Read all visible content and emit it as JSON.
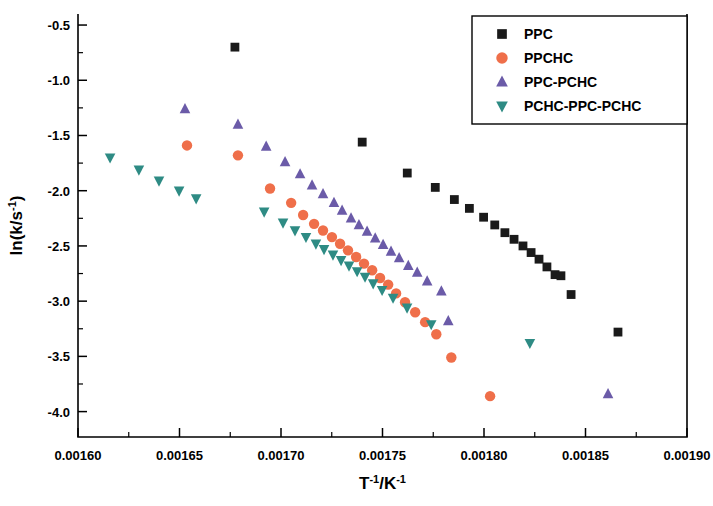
{
  "chart_data": {
    "type": "scatter",
    "title": "",
    "xlabel": "T-1/K-1",
    "xlabel_base": "T",
    "xlabel_exp1": "-1",
    "xlabel_mid": "/K",
    "xlabel_exp2": "-1",
    "ylabel": "ln(k/s-1)",
    "ylabel_base": "ln(k/s",
    "ylabel_exp": "-1",
    "ylabel_close": ")",
    "xlim": [
      0.0016,
      0.0019
    ],
    "ylim": [
      -4.23,
      -0.4
    ],
    "xticks": [
      "0.00160",
      "0.00165",
      "0.00170",
      "0.00175",
      "0.00180",
      "0.00185",
      "0.00190"
    ],
    "xtick_values": [
      0.0016,
      0.00165,
      0.0017,
      0.00175,
      0.0018,
      0.00185,
      0.0019
    ],
    "yticks": [
      "-0.5",
      "-1.0",
      "-1.5",
      "-2.0",
      "-2.5",
      "-3.0",
      "-3.5",
      "-4.0"
    ],
    "ytick_values": [
      -0.5,
      -1.0,
      -1.5,
      -2.0,
      -2.5,
      -3.0,
      -3.5,
      -4.0
    ],
    "grid": false,
    "legend_position": "top-right",
    "series": [
      {
        "name": "PPC",
        "marker": "square",
        "color": "#1a1a1a",
        "points": [
          [
            0.0016773,
            -0.7
          ],
          [
            0.00174,
            -1.56
          ],
          [
            0.0017622,
            -1.84
          ],
          [
            0.001776,
            -1.97
          ],
          [
            0.0017854,
            -2.08
          ],
          [
            0.0017928,
            -2.16
          ],
          [
            0.0017998,
            -2.24
          ],
          [
            0.0018053,
            -2.31
          ],
          [
            0.0018103,
            -2.38
          ],
          [
            0.0018148,
            -2.44
          ],
          [
            0.0018192,
            -2.5
          ],
          [
            0.0018232,
            -2.56
          ],
          [
            0.0018271,
            -2.62
          ],
          [
            0.001831,
            -2.69
          ],
          [
            0.001835,
            -2.76
          ],
          [
            0.0018379,
            -2.77
          ],
          [
            0.0018429,
            -2.94
          ],
          [
            0.001866,
            -3.28
          ]
        ]
      },
      {
        "name": "PPCHC",
        "marker": "circle",
        "color": "#ef6f4a",
        "points": [
          [
            0.0016537,
            -1.59
          ],
          [
            0.0016788,
            -1.68
          ],
          [
            0.0016946,
            -1.98
          ],
          [
            0.001705,
            -2.11
          ],
          [
            0.0017109,
            -2.22
          ],
          [
            0.0017163,
            -2.3
          ],
          [
            0.0017207,
            -2.36
          ],
          [
            0.0017251,
            -2.42
          ],
          [
            0.0017291,
            -2.48
          ],
          [
            0.001733,
            -2.54
          ],
          [
            0.001737,
            -2.6
          ],
          [
            0.0017409,
            -2.66
          ],
          [
            0.0017449,
            -2.72
          ],
          [
            0.0017488,
            -2.79
          ],
          [
            0.0017528,
            -2.85
          ],
          [
            0.0017567,
            -2.93
          ],
          [
            0.0017611,
            -3.01
          ],
          [
            0.0017661,
            -3.1
          ],
          [
            0.001771,
            -3.19
          ],
          [
            0.0017765,
            -3.3
          ],
          [
            0.0017839,
            -3.51
          ],
          [
            0.001803,
            -3.86
          ]
        ]
      },
      {
        "name": "PPC-PCHC",
        "marker": "triangle-up",
        "color": "#6b5ba8",
        "points": [
          [
            0.0016527,
            -1.26
          ],
          [
            0.0016788,
            -1.4
          ],
          [
            0.0016927,
            -1.6
          ],
          [
            0.001702,
            -1.74
          ],
          [
            0.0017094,
            -1.85
          ],
          [
            0.0017153,
            -1.95
          ],
          [
            0.0017207,
            -2.03
          ],
          [
            0.0017261,
            -2.11
          ],
          [
            0.0017301,
            -2.18
          ],
          [
            0.0017345,
            -2.25
          ],
          [
            0.0017384,
            -2.31
          ],
          [
            0.0017424,
            -2.37
          ],
          [
            0.0017464,
            -2.43
          ],
          [
            0.0017503,
            -2.49
          ],
          [
            0.0017542,
            -2.55
          ],
          [
            0.0017582,
            -2.61
          ],
          [
            0.0017627,
            -2.68
          ],
          [
            0.0017671,
            -2.74
          ],
          [
            0.001772,
            -2.82
          ],
          [
            0.001779,
            -2.91
          ],
          [
            0.0017824,
            -3.18
          ],
          [
            0.0018611,
            -3.84
          ]
        ]
      },
      {
        "name": "PCHC-PPC-PCHC",
        "marker": "triangle-down",
        "color": "#2e8b84",
        "points": [
          [
            0.0016158,
            -1.7
          ],
          [
            0.00163,
            -1.81
          ],
          [
            0.0016399,
            -1.91
          ],
          [
            0.0016498,
            -2.0
          ],
          [
            0.0016582,
            -2.07
          ],
          [
            0.0016917,
            -2.19
          ],
          [
            0.001701,
            -2.29
          ],
          [
            0.0017069,
            -2.36
          ],
          [
            0.0017123,
            -2.42
          ],
          [
            0.0017172,
            -2.48
          ],
          [
            0.0017212,
            -2.53
          ],
          [
            0.0017256,
            -2.58
          ],
          [
            0.0017296,
            -2.63
          ],
          [
            0.0017335,
            -2.68
          ],
          [
            0.0017375,
            -2.73
          ],
          [
            0.0017414,
            -2.78
          ],
          [
            0.0017454,
            -2.84
          ],
          [
            0.0017498,
            -2.9
          ],
          [
            0.0017552,
            -2.97
          ],
          [
            0.0017621,
            -3.06
          ],
          [
            0.001774,
            -3.21
          ],
          [
            0.0018226,
            -3.38
          ]
        ]
      }
    ]
  },
  "legend": {
    "entries": [
      {
        "label": "PPC",
        "marker": "square",
        "color": "#1a1a1a"
      },
      {
        "label": "PPCHC",
        "marker": "circle",
        "color": "#ef6f4a"
      },
      {
        "label": "PPC-PCHC",
        "marker": "triangle-up",
        "color": "#6b5ba8"
      },
      {
        "label": "PCHC-PPC-PCHC",
        "marker": "triangle-down",
        "color": "#2e8b84"
      }
    ]
  }
}
